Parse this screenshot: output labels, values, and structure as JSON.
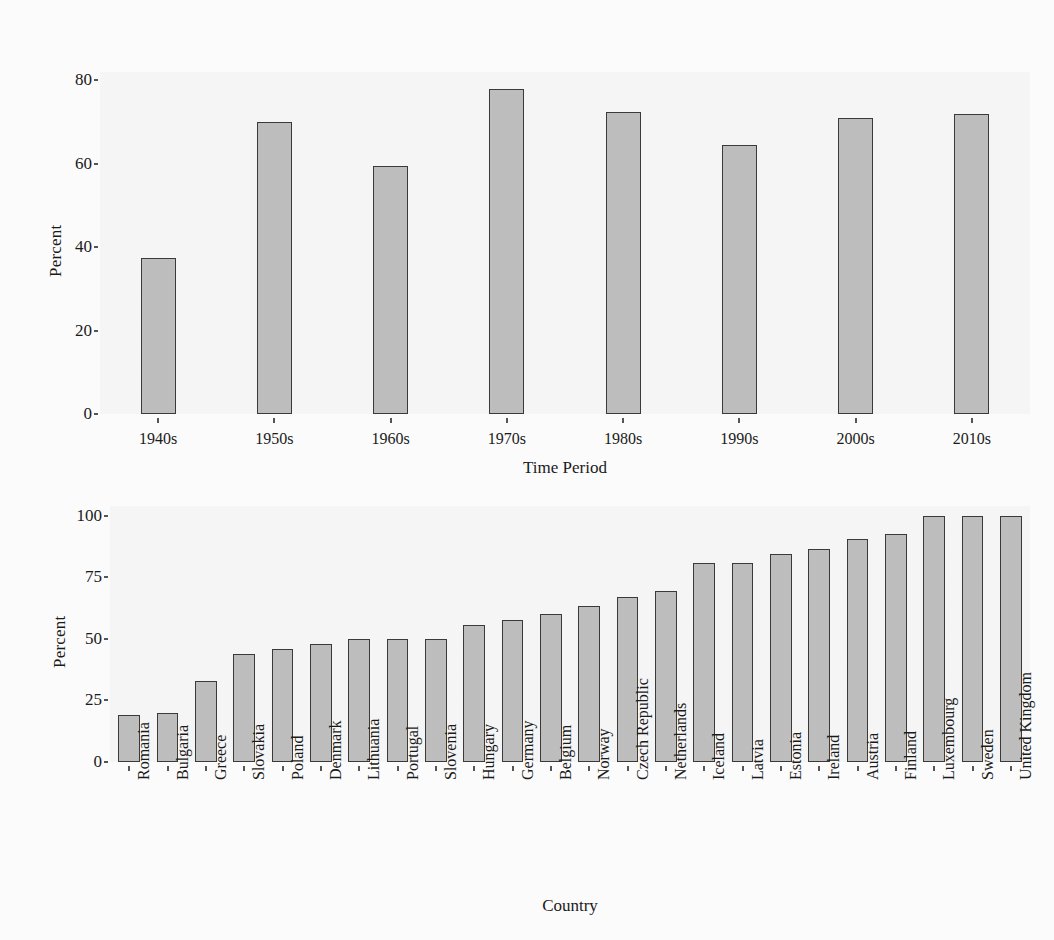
{
  "figure": {
    "background_color": "#fdfdfd",
    "panel_background_color": "#f7f7f7",
    "bar_fill_color": "#bfbfbf",
    "bar_edge_color": "#3a3a3a"
  },
  "chart_data": [
    {
      "type": "bar",
      "title": "",
      "xlabel": "Time Period",
      "ylabel": "Percent",
      "categories": [
        "1940s",
        "1950s",
        "1960s",
        "1970s",
        "1980s",
        "1990s",
        "2000s",
        "2010s"
      ],
      "values": [
        37.5,
        70.0,
        59.5,
        78.0,
        72.5,
        64.5,
        71.0,
        72.0
      ],
      "yticks": [
        0,
        20,
        40,
        60,
        80
      ],
      "ytick_labels": [
        "0",
        "20",
        "40",
        "60",
        "80"
      ],
      "ylim": [
        0,
        82
      ],
      "grid": false,
      "legend": "none",
      "orientation": "vertical"
    },
    {
      "type": "bar",
      "title": "",
      "xlabel": "Country",
      "ylabel": "Percent",
      "categories": [
        "Romania",
        "Bulgaria",
        "Greece",
        "Slovakia",
        "Poland",
        "Denmark",
        "Lithuania",
        "Portugal",
        "Slovenia",
        "Hungary",
        "Germany",
        "Belgium",
        "Norway",
        "Czech Republic",
        "Netherlands",
        "Iceland",
        "Latvia",
        "Estonia",
        "Ireland",
        "Austria",
        "Finland",
        "Luxembourg",
        "Sweden",
        "United Kingdom"
      ],
      "values": [
        19,
        20,
        33,
        44,
        46,
        48,
        50,
        50,
        50,
        55.5,
        57.5,
        60,
        63.5,
        67,
        69.5,
        81,
        81,
        84.5,
        86.5,
        90.5,
        92.5,
        100,
        100,
        100
      ],
      "yticks": [
        0,
        25,
        50,
        75,
        100
      ],
      "ytick_labels": [
        "0",
        "25",
        "50",
        "75",
        "100"
      ],
      "ylim": [
        0,
        104
      ],
      "grid": false,
      "legend": "none",
      "orientation": "vertical",
      "xtick_rotation": -90
    }
  ]
}
